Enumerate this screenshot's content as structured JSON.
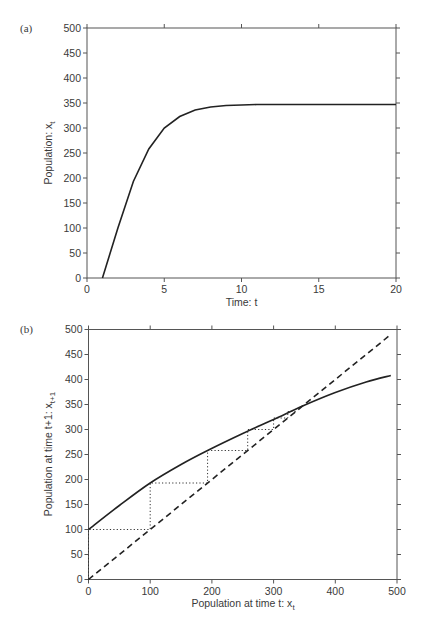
{
  "chart_data": [
    {
      "panel": "(a)",
      "type": "line",
      "title": "",
      "xlabel": "Time: t",
      "ylabel": "Population: x",
      "ylabel_sub": "t",
      "xlim": [
        0,
        20
      ],
      "ylim": [
        0,
        500
      ],
      "xticks": [
        0,
        5,
        10,
        15,
        20
      ],
      "yticks": [
        0,
        50,
        100,
        150,
        200,
        250,
        300,
        350,
        400,
        450,
        500
      ],
      "grid": false,
      "series": [
        {
          "name": "population",
          "x": [
            1,
            2,
            3,
            4,
            5,
            6,
            7,
            8,
            9,
            10,
            11,
            12,
            13,
            14,
            15,
            16,
            17,
            18,
            19,
            20
          ],
          "y": [
            0,
            100,
            193,
            258,
            300,
            323,
            336,
            342,
            345,
            346,
            347,
            347,
            347,
            347,
            347,
            347,
            347,
            347,
            347,
            347
          ]
        }
      ]
    },
    {
      "panel": "(b)",
      "type": "line",
      "title": "",
      "xlabel": "Population at time t: x",
      "xlabel_sub": "t",
      "ylabel": "Population at time t+1: x",
      "ylabel_sub": "t+1",
      "xlim": [
        0,
        500
      ],
      "ylim": [
        0,
        500
      ],
      "xticks": [
        0,
        100,
        200,
        300,
        400,
        500
      ],
      "yticks": [
        0,
        50,
        100,
        150,
        200,
        250,
        300,
        350,
        400,
        450,
        500
      ],
      "grid": false,
      "series": [
        {
          "name": "recruitment curve",
          "style": "solid",
          "x": [
            0,
            50,
            100,
            150,
            193,
            250,
            300,
            347,
            400,
            450,
            490
          ],
          "y": [
            100,
            148,
            193,
            230,
            258,
            292,
            320,
            347,
            374,
            395,
            408
          ]
        },
        {
          "name": "1:1 line",
          "style": "dashed",
          "x": [
            0,
            490
          ],
          "y": [
            0,
            490
          ]
        },
        {
          "name": "cobweb",
          "style": "dotted",
          "x": [
            0,
            0,
            100,
            100,
            193,
            193,
            258,
            258,
            300,
            300,
            323,
            323,
            336
          ],
          "y": [
            0,
            100,
            100,
            193,
            193,
            258,
            258,
            300,
            300,
            323,
            323,
            336,
            336
          ]
        }
      ]
    }
  ],
  "labels": {
    "panel_a": "(a)",
    "panel_b": "(b)",
    "a_xlabel": "Time: t",
    "a_ylabel_main": "Population: x",
    "a_ylabel_sub": "t",
    "b_xlabel_main": "Population at time t: x",
    "b_xlabel_sub": "t",
    "b_ylabel_main": "Population at time t+1: x",
    "b_ylabel_sub": "t+1"
  },
  "colors": {
    "axis": "#555555",
    "line": "#222222"
  }
}
